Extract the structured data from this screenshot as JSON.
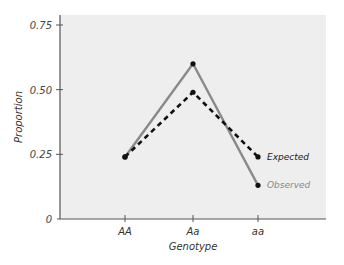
{
  "chart_data": {
    "type": "line",
    "title": "",
    "xlabel": "Genotype",
    "ylabel": "Proportion",
    "categories": [
      "AA",
      "Aa",
      "aa"
    ],
    "yticks": [
      "0",
      "0.25",
      "0.50",
      "0.75"
    ],
    "ytick_values": [
      0,
      0.25,
      0.5,
      0.75
    ],
    "ylim": [
      0,
      0.75
    ],
    "grid": false,
    "legend_position": "inline-right",
    "series": [
      {
        "name": "Expected",
        "values": [
          0.24,
          0.49,
          0.24
        ],
        "style": "dashed",
        "color": "#111111"
      },
      {
        "name": "Observed",
        "values": [
          0.24,
          0.6,
          0.13
        ],
        "style": "solid",
        "color": "#8a8a8a"
      }
    ]
  },
  "colors": {
    "panel_background": "#eeeeee",
    "axis": "#555555",
    "expected_line": "#111111",
    "observed_line": "#8a8a8a"
  }
}
